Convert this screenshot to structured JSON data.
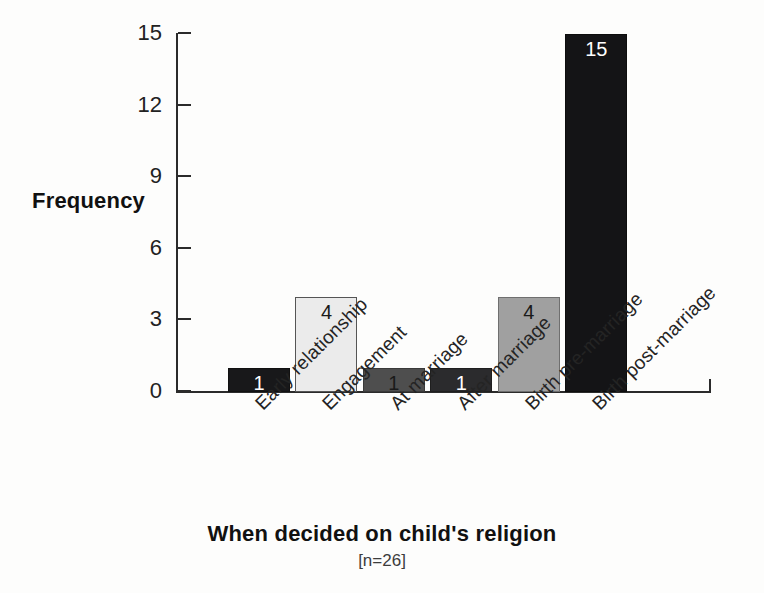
{
  "chart_data": {
    "type": "bar",
    "title": "",
    "xlabel": "When decided on child's religion",
    "xsublabel": "[n=26]",
    "ylabel": "Frequency",
    "ylim": [
      0,
      15
    ],
    "yticks": [
      0,
      3,
      6,
      9,
      12,
      15
    ],
    "ytick_labels": [
      "0",
      "3",
      "6",
      "9",
      "12",
      "15"
    ],
    "grid": false,
    "legend": false,
    "categories": [
      "Early relationship",
      "Engagement",
      "At marriage",
      "After marriage",
      "Birth pre-marriage",
      "Birth post-marriage"
    ],
    "values": [
      1,
      4,
      1,
      1,
      4,
      15
    ],
    "data_labels": [
      "1",
      "4",
      "1",
      "1",
      "4",
      "15"
    ],
    "bars": [
      {
        "category": "Early relationship",
        "value": 1,
        "label": "1",
        "fill": "#18181a",
        "border": "#111111",
        "label_color": "light"
      },
      {
        "category": "Engagement",
        "value": 4,
        "label": "4",
        "fill": "#ebebeb",
        "border": "#555555",
        "label_color": "dark"
      },
      {
        "category": "At marriage",
        "value": 1,
        "label": "1",
        "fill": "#4e4e4e",
        "border": "#3a3a3a",
        "label_color": "dark"
      },
      {
        "category": "After marriage",
        "value": 1,
        "label": "1",
        "fill": "#2b2b2d",
        "border": "#1f1f1f",
        "label_color": "light"
      },
      {
        "category": "Birth pre-marriage",
        "value": 4,
        "label": "4",
        "fill": "#a0a0a0",
        "border": "#6f6f6f",
        "label_color": "dark"
      },
      {
        "category": "Birth post-marriage",
        "value": 15,
        "label": "15",
        "fill": "#141416",
        "border": "#0d0d0d",
        "label_color": "light"
      }
    ]
  }
}
